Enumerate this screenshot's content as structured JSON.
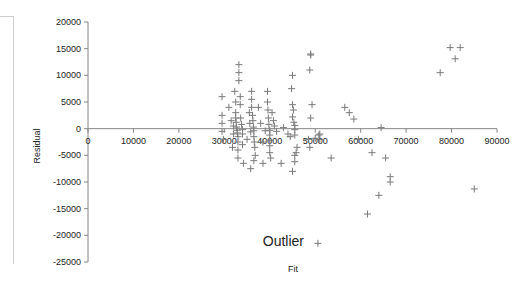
{
  "chart_data": {
    "type": "scatter",
    "title": "",
    "xlabel": "Fit",
    "ylabel": "Residual",
    "xlim": [
      0,
      90000
    ],
    "ylim": [
      -25000,
      20000
    ],
    "x_ticks": [
      "0",
      "10000",
      "20000",
      "30000",
      "40000",
      "50000",
      "60000",
      "70000",
      "80000",
      "90000"
    ],
    "y_ticks": [
      "20000",
      "15000",
      "10000",
      "5000",
      "0",
      "-5000",
      "-10000",
      "-15000",
      "-20000",
      "-25000"
    ],
    "grid": false,
    "legend": null,
    "marker": "+",
    "marker_color": "#7a7a7a",
    "annotations": [
      {
        "text": "Outlier",
        "x": 43000,
        "y": -21000
      }
    ],
    "series": [
      {
        "name": "Residuals",
        "points": [
          [
            29500,
            6000
          ],
          [
            29500,
            2500
          ],
          [
            29500,
            1000
          ],
          [
            29500,
            -500
          ],
          [
            29800,
            -2000
          ],
          [
            31000,
            4000
          ],
          [
            31500,
            1500
          ],
          [
            32000,
            500
          ],
          [
            32000,
            -1000
          ],
          [
            31800,
            -3500
          ],
          [
            32300,
            7000
          ],
          [
            32500,
            5000
          ],
          [
            32500,
            3000
          ],
          [
            32500,
            2000
          ],
          [
            32600,
            1200
          ],
          [
            32700,
            300
          ],
          [
            32800,
            -300
          ],
          [
            32900,
            -800
          ],
          [
            33000,
            -1500
          ],
          [
            33000,
            -2500
          ],
          [
            33000,
            -4000
          ],
          [
            33000,
            -5500
          ],
          [
            33200,
            12000
          ],
          [
            33200,
            10500
          ],
          [
            33200,
            9000
          ],
          [
            33500,
            6000
          ],
          [
            33500,
            4500
          ],
          [
            33600,
            2000
          ],
          [
            33800,
            800
          ],
          [
            34000,
            -200
          ],
          [
            34000,
            -1000
          ],
          [
            34000,
            -3000
          ],
          [
            34200,
            -6500
          ],
          [
            35000,
            -2000
          ],
          [
            35500,
            3000
          ],
          [
            35600,
            1000
          ],
          [
            35800,
            -600
          ],
          [
            36000,
            7000
          ],
          [
            36000,
            5500
          ],
          [
            36000,
            4000
          ],
          [
            36200,
            2500
          ],
          [
            36300,
            1500
          ],
          [
            36400,
            300
          ],
          [
            36500,
            -400
          ],
          [
            36500,
            -1500
          ],
          [
            36600,
            -2500
          ],
          [
            36700,
            -3500
          ],
          [
            36800,
            -5000
          ],
          [
            36500,
            -6000
          ],
          [
            35800,
            -7500
          ],
          [
            37500,
            4000
          ],
          [
            38000,
            1000
          ],
          [
            38500,
            -2500
          ],
          [
            38500,
            -6500
          ],
          [
            39000,
            -400
          ],
          [
            39500,
            7000
          ],
          [
            39500,
            5000
          ],
          [
            39600,
            3500
          ],
          [
            39700,
            2000
          ],
          [
            39800,
            800
          ],
          [
            40000,
            -300
          ],
          [
            40000,
            -1200
          ],
          [
            40000,
            -2200
          ],
          [
            40000,
            -3200
          ],
          [
            40000,
            -4500
          ],
          [
            40200,
            -5500
          ],
          [
            40500,
            3000
          ],
          [
            40800,
            1500
          ],
          [
            41000,
            500
          ],
          [
            41500,
            -500
          ],
          [
            42500,
            -6500
          ],
          [
            43000,
            200
          ],
          [
            44000,
            -1000
          ],
          [
            44500,
            -1500
          ],
          [
            45000,
            10000
          ],
          [
            44800,
            7500
          ],
          [
            45000,
            4500
          ],
          [
            45200,
            3500
          ],
          [
            45000,
            2200
          ],
          [
            45300,
            1200
          ],
          [
            45500,
            600
          ],
          [
            45500,
            -200
          ],
          [
            45500,
            -1200
          ],
          [
            45800,
            -4500
          ],
          [
            45500,
            -6200
          ],
          [
            45000,
            -8000
          ],
          [
            45500,
            -5000
          ],
          [
            46000,
            -3500
          ],
          [
            49000,
            14000
          ],
          [
            49000,
            13800
          ],
          [
            48800,
            11000
          ],
          [
            49300,
            4500
          ],
          [
            49000,
            2000
          ],
          [
            48500,
            -2000
          ],
          [
            48800,
            -3500
          ],
          [
            50000,
            -1800
          ],
          [
            51000,
            -1000
          ],
          [
            51000,
            -2000
          ],
          [
            50800,
            -1200
          ],
          [
            53500,
            -5500
          ],
          [
            56500,
            4000
          ],
          [
            57500,
            3000
          ],
          [
            58500,
            1800
          ],
          [
            59500,
            -2000
          ],
          [
            64500,
            200
          ],
          [
            62500,
            -4500
          ],
          [
            65500,
            -5500
          ],
          [
            66500,
            -9000
          ],
          [
            66500,
            -10000
          ],
          [
            64000,
            -12500
          ],
          [
            61500,
            -16000
          ],
          [
            77500,
            10500
          ],
          [
            79700,
            15200
          ],
          [
            81900,
            15200
          ],
          [
            80800,
            13100
          ],
          [
            85000,
            -11300
          ],
          [
            50600,
            -21500
          ]
        ]
      }
    ]
  }
}
